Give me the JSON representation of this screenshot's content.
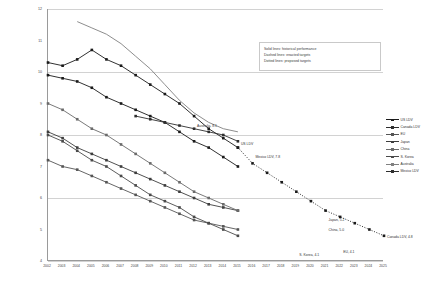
{
  "chart_data": {
    "type": "line",
    "title": "",
    "xlabel": "",
    "ylabel": "Liters per 100 kilometers (Gasoline Equivalent) Normalized to NEDC",
    "xlim": [
      2002,
      2025
    ],
    "ylim": [
      4,
      12
    ],
    "grid": true,
    "legend_position": "right",
    "x": [
      2002,
      2003,
      2004,
      2005,
      2006,
      2007,
      2008,
      2009,
      2010,
      2011,
      2012,
      2013,
      2014,
      2015,
      2016,
      2017,
      2018,
      2019,
      2020,
      2021,
      2022,
      2023,
      2024,
      2025
    ],
    "yticks": [
      12,
      11,
      10,
      9,
      8,
      7,
      6,
      5,
      4
    ],
    "gridlines": [
      12,
      10,
      8,
      6,
      4
    ],
    "xticks": [
      "2002",
      "2003",
      "2004",
      "2005",
      "2006",
      "2007",
      "2008",
      "2009",
      "2010",
      "2011",
      "2012",
      "2013",
      "2014",
      "2015",
      "2016",
      "2017",
      "2018",
      "2019",
      "2020",
      "2021",
      "2022",
      "2023",
      "2024",
      "2025"
    ],
    "series": [
      {
        "name": "US LDV",
        "color": "#1a1a1a",
        "style": "solid",
        "marker": "square",
        "x": [
          2002,
          2003,
          2004,
          2005,
          2006,
          2007,
          2008,
          2009,
          2010,
          2011,
          2012,
          2013,
          2014,
          2015
        ],
        "values": [
          10.3,
          10.2,
          10.4,
          10.7,
          10.4,
          10.2,
          9.9,
          9.6,
          9.3,
          9.0,
          8.6,
          8.2,
          7.9,
          7.6
        ],
        "endpoint_label": "US LDV"
      },
      {
        "name": "US LDV proposed",
        "color": "#1a1a1a",
        "style": "dotted",
        "marker": "square",
        "x": [
          2015,
          2016,
          2017,
          2018,
          2019,
          2020,
          2021,
          2022,
          2023,
          2024,
          2025
        ],
        "values": [
          7.6,
          7.1,
          6.8,
          6.5,
          6.2,
          5.9,
          5.6,
          5.4,
          5.2,
          5.0,
          4.8
        ],
        "endpoint_label": "Canada LDV, 4.8"
      },
      {
        "name": "Canada LDV",
        "color": "#1a1a1a",
        "style": "solid",
        "marker": "square",
        "x": [
          2002,
          2003,
          2004,
          2005,
          2006,
          2007,
          2008,
          2009,
          2010,
          2011,
          2012,
          2013,
          2014,
          2015
        ],
        "values": [
          9.9,
          9.8,
          9.7,
          9.5,
          9.2,
          9.0,
          8.8,
          8.6,
          8.4,
          8.1,
          7.8,
          7.6,
          7.3,
          7.0
        ],
        "endpoint_label": "Mexico LDV, 7.8"
      },
      {
        "name": "EU",
        "color": "#555555",
        "style": "solid",
        "marker": "square",
        "x": [
          2002,
          2003,
          2004,
          2005,
          2006,
          2007,
          2008,
          2009,
          2010,
          2011,
          2012,
          2013,
          2014,
          2015
        ],
        "values": [
          7.2,
          7.0,
          6.9,
          6.7,
          6.5,
          6.3,
          6.1,
          5.9,
          5.7,
          5.5,
          5.3,
          5.2,
          5.1,
          5.0
        ],
        "endpoint_label": "EU, 4.1"
      },
      {
        "name": "Japan",
        "color": "#3d3d3d",
        "style": "solid",
        "marker": "square",
        "x": [
          2002,
          2003,
          2004,
          2005,
          2006,
          2007,
          2008,
          2009,
          2010,
          2011,
          2012,
          2013,
          2014,
          2015
        ],
        "values": [
          8.1,
          7.9,
          7.6,
          7.4,
          7.2,
          7.0,
          6.8,
          6.6,
          6.4,
          6.2,
          6.0,
          5.8,
          5.7,
          5.6
        ],
        "endpoint_label": "Japan, 5.2"
      },
      {
        "name": "China",
        "color": "#6a6a6a",
        "style": "solid",
        "marker": "square",
        "x": [
          2002,
          2003,
          2004,
          2005,
          2006,
          2007,
          2008,
          2009,
          2010,
          2011,
          2012,
          2013,
          2014,
          2015
        ],
        "values": [
          9.0,
          8.8,
          8.5,
          8.2,
          8.0,
          7.7,
          7.4,
          7.1,
          6.8,
          6.5,
          6.2,
          6.0,
          5.8,
          5.6
        ],
        "endpoint_label": "China, 5.0"
      },
      {
        "name": "S. Korea",
        "color": "#4a4a4a",
        "style": "solid",
        "marker": "square",
        "x": [
          2002,
          2003,
          2004,
          2005,
          2006,
          2007,
          2008,
          2009,
          2010,
          2011,
          2012,
          2013,
          2014,
          2015
        ],
        "values": [
          8.0,
          7.8,
          7.5,
          7.2,
          7.0,
          6.7,
          6.4,
          6.1,
          5.9,
          5.7,
          5.4,
          5.2,
          5.0,
          4.8
        ],
        "endpoint_label": "S. Korea, 4.1"
      },
      {
        "name": "Australia",
        "color": "#808080",
        "style": "solid",
        "marker": "none",
        "x": [
          2004,
          2005,
          2006,
          2007,
          2008,
          2009,
          2010,
          2011,
          2012,
          2013,
          2014,
          2015
        ],
        "values": [
          11.6,
          11.4,
          11.2,
          10.9,
          10.5,
          10.1,
          9.6,
          9.1,
          8.7,
          8.4,
          8.2,
          8.1
        ],
        "endpoint_label": "Australia, 8.1"
      },
      {
        "name": "Mexico LDV",
        "color": "#2e2e2e",
        "style": "solid",
        "marker": "square",
        "x": [
          2008,
          2009,
          2010,
          2011,
          2012,
          2013,
          2014,
          2015
        ],
        "values": [
          8.6,
          8.5,
          8.4,
          8.3,
          8.2,
          8.1,
          8.0,
          7.8
        ],
        "endpoint_label": ""
      }
    ],
    "annotations": [
      {
        "text": "Australia, 8.1",
        "x": 2012,
        "y": 8.3
      },
      {
        "text": "US LDV",
        "x": 2015,
        "y": 7.7
      },
      {
        "text": "Mexico LDV, 7.8",
        "x": 2016,
        "y": 7.3
      },
      {
        "text": "Japan, 5.2",
        "x": 2021,
        "y": 5.3
      },
      {
        "text": "China, 5.0",
        "x": 2021,
        "y": 5.0
      },
      {
        "text": "S. Korea, 4.1",
        "x": 2019,
        "y": 4.2
      },
      {
        "text": "EU, 4.1",
        "x": 2022,
        "y": 4.3
      },
      {
        "text": "Canada LDV, 4.8",
        "x": 2025,
        "y": 4.75
      }
    ]
  },
  "note_box": {
    "line1": "Solid lines: historical performance",
    "line2": "Dashed lines: enacted targets",
    "line3": "Dotted lines: proposed targets"
  },
  "legend": {
    "items": [
      {
        "label": "US LDV",
        "color": "#1a1a1a"
      },
      {
        "label": "Canada LDV",
        "color": "#2e2e2e"
      },
      {
        "label": "EU",
        "color": "#555555"
      },
      {
        "label": "Japan",
        "color": "#3d3d3d"
      },
      {
        "label": "China",
        "color": "#6a6a6a"
      },
      {
        "label": "S. Korea",
        "color": "#4a4a4a"
      },
      {
        "label": "Australia",
        "color": "#808080"
      },
      {
        "label": "Mexico LDV",
        "color": "#2e2e2e"
      }
    ]
  }
}
